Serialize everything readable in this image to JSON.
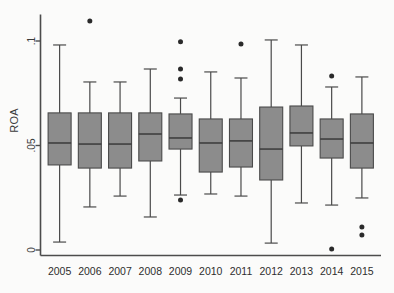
{
  "chart_data": {
    "type": "box",
    "title": "",
    "xlabel": "",
    "ylabel": "ROA",
    "ylim": [
      -0.0025,
      0.1105
    ],
    "ytick_values": [
      0,
      0.05,
      0.1
    ],
    "ytick_labels": [
      "0",
      ".05",
      ".1"
    ],
    "grid": false,
    "legend": "none",
    "categories": [
      "2005",
      "2006",
      "2007",
      "2008",
      "2009",
      "2010",
      "2011",
      "2012",
      "2013",
      "2014",
      "2015"
    ],
    "series": [
      {
        "name": "2005",
        "whisker_low": 0.0038,
        "q1": 0.0407,
        "median": 0.0512,
        "q3": 0.0656,
        "whisker_high": 0.0981,
        "outliers": []
      },
      {
        "name": "2006",
        "whisker_low": 0.0206,
        "q1": 0.0392,
        "median": 0.0507,
        "q3": 0.0656,
        "whisker_high": 0.0804,
        "outliers": [
          0.1096
        ]
      },
      {
        "name": "2007",
        "whisker_low": 0.0258,
        "q1": 0.0392,
        "median": 0.0507,
        "q3": 0.0656,
        "whisker_high": 0.0804,
        "outliers": []
      },
      {
        "name": "2008",
        "whisker_low": 0.0158,
        "q1": 0.0426,
        "median": 0.0555,
        "q3": 0.0656,
        "whisker_high": 0.0866,
        "outliers": []
      },
      {
        "name": "2009",
        "whisker_low": 0.0263,
        "q1": 0.0483,
        "median": 0.0536,
        "q3": 0.0651,
        "whisker_high": 0.0727,
        "outliers": [
          0.0996,
          0.0866,
          0.0818,
          0.0239
        ]
      },
      {
        "name": "2010",
        "whisker_low": 0.0268,
        "q1": 0.0373,
        "median": 0.0512,
        "q3": 0.0627,
        "whisker_high": 0.0852,
        "outliers": []
      },
      {
        "name": "2011",
        "whisker_low": 0.0258,
        "q1": 0.0397,
        "median": 0.0522,
        "q3": 0.0627,
        "whisker_high": 0.0823,
        "outliers": [
          0.0986
        ]
      },
      {
        "name": "2012",
        "whisker_low": 0.0033,
        "q1": 0.0335,
        "median": 0.0483,
        "q3": 0.0684,
        "whisker_high": 0.1005,
        "outliers": []
      },
      {
        "name": "2013",
        "whisker_low": 0.0225,
        "q1": 0.0498,
        "median": 0.056,
        "q3": 0.0689,
        "whisker_high": 0.0981,
        "outliers": []
      },
      {
        "name": "2014",
        "whisker_low": 0.0215,
        "q1": 0.044,
        "median": 0.0531,
        "q3": 0.0627,
        "whisker_high": 0.078,
        "outliers": [
          0.0833,
          0.0005
        ]
      },
      {
        "name": "2015",
        "whisker_low": 0.0249,
        "q1": 0.0392,
        "median": 0.0512,
        "q3": 0.0651,
        "whisker_high": 0.0828,
        "outliers": [
          0.011,
          0.0072
        ]
      }
    ],
    "style": {
      "box_fill": "#8c8c8c",
      "box_stroke": "#4a4a4a",
      "whisker_stroke": "#4a4a4a",
      "median_stroke": "#3a3a3a",
      "outlier_fill": "#2a2a2a",
      "axis_stroke": "#4c4c4c",
      "background": "#fbfbfa"
    }
  }
}
